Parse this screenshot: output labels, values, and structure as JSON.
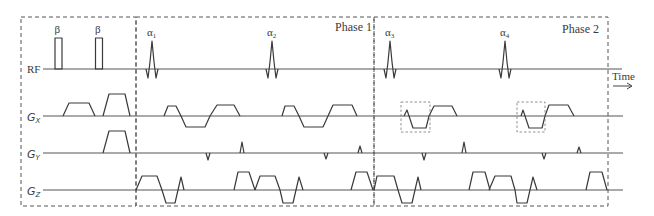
{
  "diagram": {
    "type": "MRI pulse sequence timing diagram",
    "phases": [
      {
        "id": "prep",
        "label": ""
      },
      {
        "id": "phase1",
        "label": "Phase 1"
      },
      {
        "id": "phase2",
        "label": "Phase 2"
      }
    ],
    "rows": [
      {
        "id": "rf",
        "label": "RF"
      },
      {
        "id": "gx",
        "label": "G",
        "subscript": "X"
      },
      {
        "id": "gy",
        "label": "G",
        "subscript": "Y"
      },
      {
        "id": "gz",
        "label": "G",
        "subscript": "Z"
      }
    ],
    "rf_pulses": [
      {
        "type": "hard",
        "label": "β"
      },
      {
        "type": "hard",
        "label": "β"
      },
      {
        "type": "sinc",
        "label": "α",
        "subscript": "1"
      },
      {
        "type": "sinc",
        "label": "α",
        "subscript": "2"
      },
      {
        "type": "sinc",
        "label": "α",
        "subscript": "3"
      },
      {
        "type": "sinc",
        "label": "α",
        "subscript": "4"
      }
    ],
    "time_axis_label": "Time",
    "time_arrow": "→",
    "highlighted_regions": [
      "gx-bipolar-phase2-a",
      "gx-bipolar-phase2-b"
    ]
  }
}
